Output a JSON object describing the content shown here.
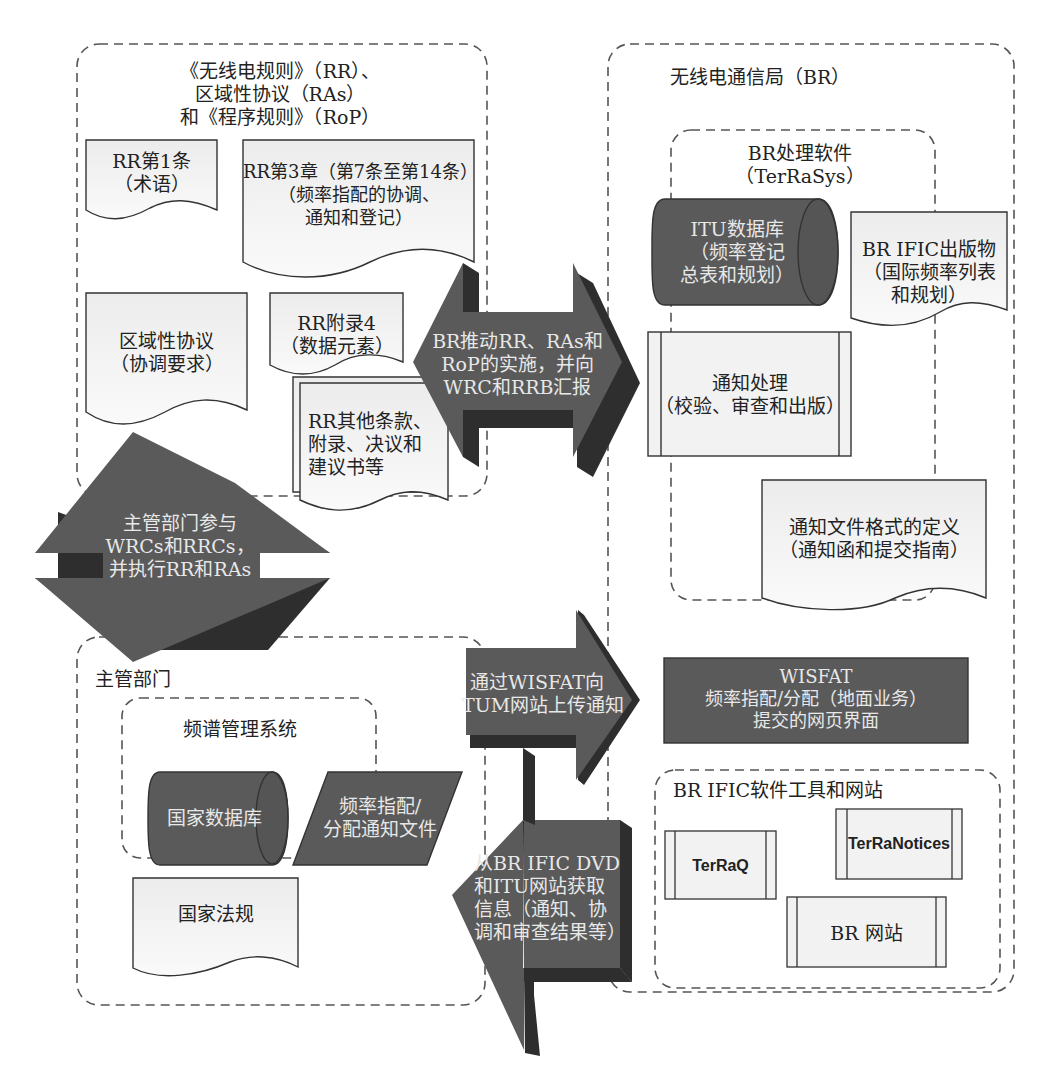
{
  "rr_group": {
    "title_line1": "《无线电规则》（RR）、",
    "title_line2": "区域性协议（RAs）",
    "title_line3": "和《程序规则》（RoP）",
    "doc_art1": {
      "line1": "RR第1条",
      "line2": "（术语）"
    },
    "doc_ch3": {
      "line1": "RR第3章（第7条至第14条）",
      "line2": "（频率指配的协调、",
      "line3": "通知和登记）"
    },
    "doc_ra": {
      "line1": "区域性协议",
      "line2": "（协调要求）"
    },
    "doc_ap4": {
      "line1": "RR附录4",
      "line2": "（数据元素）"
    },
    "doc_other": {
      "line1": "RR其他条款、",
      "line2": "附录、决议和",
      "line3": "建议书等"
    }
  },
  "br_group": {
    "title": "无线电通信局（BR）",
    "software_group": {
      "title_line1": "BR处理软件",
      "title_line2": "（TerRaSys）",
      "itu_db": {
        "line1": "ITU数据库",
        "line2": "（频率登记",
        "line3": "总表和规划）"
      },
      "notice_processing": {
        "line1": "通知处理",
        "line2": "（校验、审查和出版）"
      },
      "notice_format": {
        "line1": "通知文件格式的定义",
        "line2": "（通知函和提交指南）"
      }
    },
    "ific_pub": {
      "line1": "BR IFIC出版物",
      "line2": "（国际频率列表",
      "line3": "和规划）"
    },
    "wisfat": {
      "line1": "WISFAT",
      "line2": "频率指配/分配（地面业务）",
      "line3": "提交的网页界面"
    },
    "tools_group": {
      "title": "BR IFIC软件工具和网站",
      "terraq": "TerRaQ",
      "terranotices": "TerRaNotices",
      "br_website": "BR 网站"
    }
  },
  "admin_group": {
    "title": "主管部门",
    "sms_group": {
      "title": "频谱管理系统",
      "national_db": "国家数据库",
      "notice_file": {
        "line1": "频率指配/",
        "line2": "分配通知文件"
      }
    },
    "national_law": "国家法规"
  },
  "arrows": {
    "br_impl": {
      "line1": "BR推动RR、RAs和",
      "line2": "RoP的实施，并向",
      "line3": "WRC和RRB汇报"
    },
    "admin_participate": {
      "line1": "主管部门参与",
      "line2": "WRCs和RRCs，",
      "line3": "并执行RR和RAs"
    },
    "wisfat_upload": {
      "line1": "通过WISFAT向",
      "line2": "TUM网站上传通知"
    },
    "ific_fetch": {
      "line1": "从BR IFIC DVD",
      "line2": "和ITU网站获取",
      "line3": "信息（通知、协",
      "line4": "调和审查结果等）"
    }
  },
  "colors": {
    "dark_fill": "#5a5a5a",
    "dark_shadow": "#2e2e2e",
    "light_fill": "#f4f4f4",
    "stroke": "#333333",
    "dash": "#555555"
  }
}
